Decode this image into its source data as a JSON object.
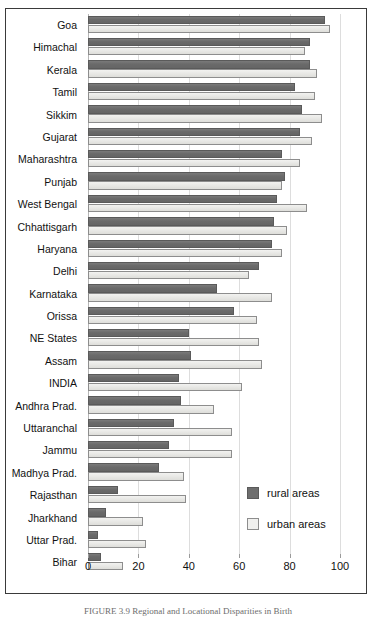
{
  "chart_data": {
    "type": "bar",
    "orientation": "horizontal",
    "title": "",
    "xlabel": "",
    "ylabel": "",
    "xlim": [
      0,
      100
    ],
    "xticks": [
      0,
      20,
      40,
      60,
      80,
      100
    ],
    "grid": true,
    "legend_position": "center-right",
    "categories": [
      "Goa",
      "Himachal",
      "Kerala",
      "Tamil",
      "Sikkim",
      "Gujarat",
      "Maharashtra",
      "Punjab",
      "West Bengal",
      "Chhattisgarh",
      "Haryana",
      "Delhi",
      "Karnataka",
      "Orissa",
      "NE States",
      "Assam",
      "INDIA",
      "Andhra Prad.",
      "Uttaranchal",
      "Jammu",
      "Madhya Prad.",
      "Rajasthan",
      "Jharkhand",
      "Uttar Prad.",
      "Bihar"
    ],
    "series": [
      {
        "name": "rural areas",
        "color": "#6e6e6e",
        "values": [
          94,
          88,
          88,
          82,
          85,
          84,
          77,
          78,
          75,
          74,
          73,
          68,
          51,
          58,
          40,
          41,
          36,
          37,
          34,
          32,
          28,
          12,
          7,
          4,
          5
        ]
      },
      {
        "name": "urban areas",
        "color": "#ebebe8",
        "values": [
          96,
          86,
          91,
          90,
          93,
          89,
          84,
          77,
          87,
          79,
          77,
          64,
          73,
          67,
          68,
          69,
          61,
          50,
          57,
          57,
          38,
          39,
          22,
          23,
          14
        ]
      }
    ]
  },
  "legend": {
    "items": [
      {
        "label": "rural areas",
        "swatch": "rural"
      },
      {
        "label": "urban areas",
        "swatch": "urban"
      }
    ]
  },
  "caption": {
    "text": "FIGURE 3.9  Regional and Locational Disparities in Birth"
  }
}
